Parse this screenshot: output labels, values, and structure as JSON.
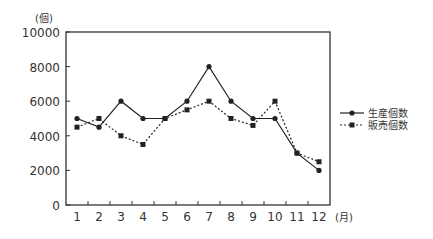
{
  "chart_data": {
    "type": "line",
    "title": "",
    "xlabel": "(月)",
    "ylabel": "(個)",
    "ylim": [
      0,
      10000
    ],
    "yticks": [
      0,
      2000,
      4000,
      6000,
      8000,
      10000
    ],
    "x": [
      "1",
      "2",
      "3",
      "4",
      "5",
      "6",
      "7",
      "8",
      "9",
      "10",
      "11",
      "12"
    ],
    "series": [
      {
        "name": "生産個数",
        "style": "solid",
        "marker": "diamond",
        "values": [
          5000,
          4500,
          6000,
          5000,
          5000,
          6000,
          8000,
          6000,
          5000,
          5000,
          3000,
          2000
        ]
      },
      {
        "name": "販売個数",
        "style": "dotted",
        "marker": "square",
        "values": [
          4500,
          5000,
          4000,
          3500,
          5000,
          5500,
          6000,
          5000,
          4600,
          6000,
          3000,
          2500
        ]
      }
    ],
    "legend_position": "right",
    "grid": false
  }
}
